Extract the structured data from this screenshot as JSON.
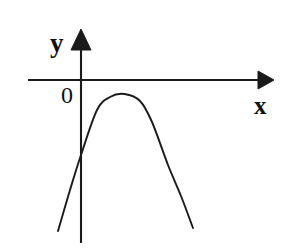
{
  "figure": {
    "background_color": "#ffffff",
    "ink_color": "#1a1a1a",
    "width": 286,
    "height": 249
  },
  "labels": {
    "y_axis": "y",
    "x_axis": "x",
    "origin": "0"
  },
  "chart_data": {
    "type": "line",
    "title": "",
    "xlabel": "x",
    "ylabel": "y",
    "grid": false,
    "legend": null,
    "annotations": [
      "0"
    ],
    "axes": {
      "x_axis": {
        "label": "x",
        "start_px": [
          28,
          80
        ],
        "end_px": [
          272,
          80
        ],
        "arrow": "right",
        "ticks": [],
        "tick_labels": []
      },
      "y_axis": {
        "label": "y",
        "start_px": [
          81,
          243
        ],
        "end_px": [
          81,
          30
        ],
        "arrow": "up",
        "ticks": [],
        "tick_labels": []
      },
      "origin_px": [
        81,
        80
      ],
      "origin_label": "0"
    },
    "curve": {
      "name": "parabola",
      "shape": "downward-opening parabola",
      "opens": "down",
      "vertex_px": [
        124.5,
        94
      ],
      "y_intercept_px": [
        81,
        155
      ],
      "x_intercepts_px": [
        [
          97,
          80
        ],
        [
          152,
          80
        ]
      ],
      "left_end_px": [
        58,
        231
      ],
      "right_end_px": [
        193,
        228
      ],
      "stroke_color": "#1a1a1a",
      "stroke_width": 1.9,
      "x_px": [
        58,
        70,
        81,
        97,
        110,
        124.5,
        140,
        152,
        168,
        181,
        193
      ],
      "y_px": [
        231,
        190,
        155,
        110,
        97,
        94,
        101,
        122,
        165,
        196,
        228
      ]
    }
  }
}
